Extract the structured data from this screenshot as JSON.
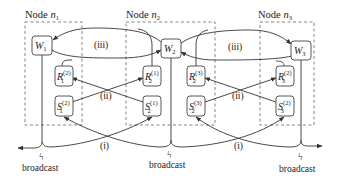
{
  "diagram": {
    "nodes": [
      {
        "id": "n1",
        "label_prefix": "Node ",
        "label_var": "n",
        "label_sub": "1"
      },
      {
        "id": "n2",
        "label_prefix": "Node ",
        "label_var": "n",
        "label_sub": "2"
      },
      {
        "id": "n3",
        "label_prefix": "Node ",
        "label_var": "n",
        "label_sub": "3"
      }
    ],
    "blocks": {
      "W1": {
        "var": "W",
        "sub": "1",
        "sup": ""
      },
      "W2": {
        "var": "W",
        "sub": "2",
        "sup": ""
      },
      "W3": {
        "var": "W",
        "sub": "3",
        "sup": ""
      },
      "R1_2": {
        "var": "R",
        "sub": "1",
        "sup": "(2)"
      },
      "R2_1": {
        "var": "R",
        "sub": "2",
        "sup": "(1)"
      },
      "R2_3": {
        "var": "R",
        "sub": "2",
        "sup": "(3)"
      },
      "R3_2": {
        "var": "R",
        "sub": "3",
        "sup": "(2)"
      },
      "S1_2": {
        "var": "S",
        "sub": "1",
        "sup": "(2)"
      },
      "S2_1": {
        "var": "S",
        "sub": "2",
        "sup": "(1)"
      },
      "S2_3": {
        "var": "S",
        "sub": "2",
        "sup": "(3)"
      },
      "S3_2": {
        "var": "S",
        "sub": "3",
        "sup": "(2)"
      }
    },
    "phases": {
      "i_left": "(i)",
      "i_right": "(i)",
      "ii_left": "(ii)",
      "ii_right": "(ii)",
      "iii_left": "(iii)",
      "iii_right": "(iii)"
    },
    "broadcast": {
      "left": "broadcast",
      "middle": "broadcast",
      "right": "broadcast",
      "symbol": "ϟ"
    },
    "colors": {
      "line": "#333333",
      "dashed": "#666666",
      "box_stroke": "#444444",
      "box_fill": "#ffffff"
    }
  }
}
